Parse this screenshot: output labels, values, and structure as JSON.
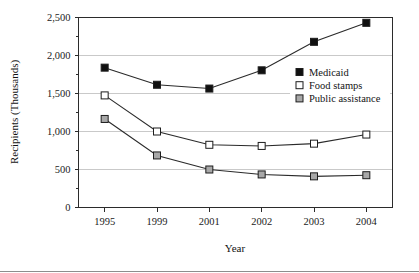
{
  "chart_data": {
    "type": "line",
    "title": "",
    "xlabel": "Year",
    "ylabel": "Recipients (Thousands)",
    "categories": [
      "1995",
      "1999",
      "2001",
      "2002",
      "2003",
      "2004"
    ],
    "ylim": [
      0,
      2500
    ],
    "yticks": [
      0,
      500,
      1000,
      1500,
      2000,
      2500
    ],
    "ytick_labels": [
      "0",
      "500",
      "1,000",
      "1,500",
      "2,000",
      "2,500"
    ],
    "grid": true,
    "legend_position": "inside-right-upper",
    "series": [
      {
        "name": "Medicaid",
        "marker": "filled-square",
        "color": "#101010",
        "values": [
          1840,
          1615,
          1565,
          1805,
          2180,
          2430
        ]
      },
      {
        "name": "Food stamps",
        "marker": "open-square",
        "color": "#ffffff",
        "values": [
          1475,
          1000,
          825,
          810,
          840,
          960
        ]
      },
      {
        "name": "Public assistance",
        "marker": "gray-square",
        "color": "#a8a8a8",
        "values": [
          1165,
          685,
          500,
          435,
          410,
          425
        ]
      }
    ]
  },
  "axes": {
    "x_title": "Year",
    "y_title": "Recipients (Thousands)"
  },
  "legend": {
    "entries": [
      {
        "label": "Medicaid"
      },
      {
        "label": "Food stamps"
      },
      {
        "label": "Public assistance"
      }
    ]
  }
}
